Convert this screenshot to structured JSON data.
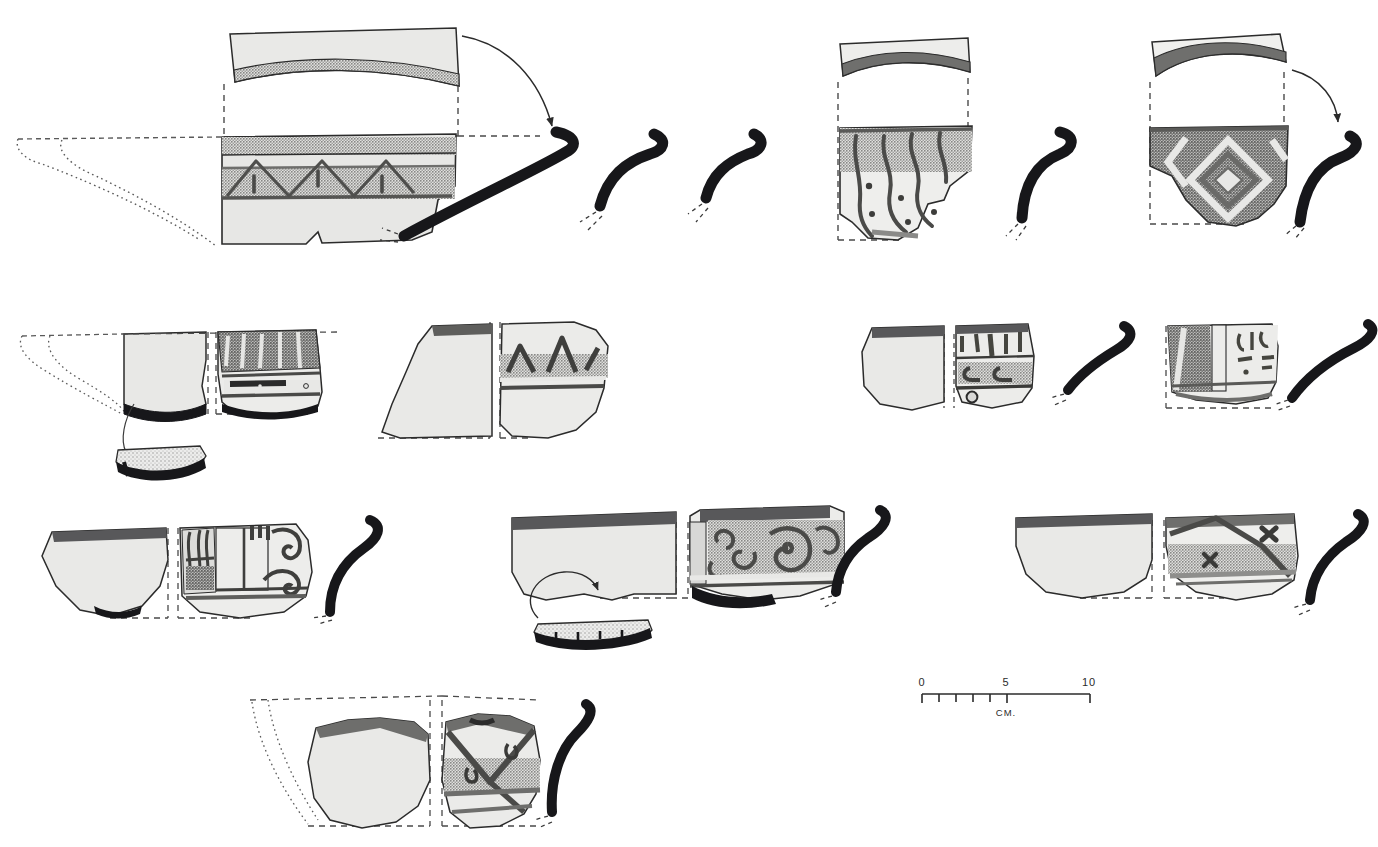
{
  "figure": {
    "type": "archaeological-pottery-plate",
    "medium": "ink drawing / halftone plate",
    "background_color": "#ffffff",
    "rows": 4,
    "total_entries": 14
  },
  "palette": {
    "outline": "#2b2b2b",
    "body_fill": "#e4e4e2",
    "stipple_light": "#c9c9c7",
    "stipple_mid": "#b2b2b0",
    "stipple_dark": "#9a9a98",
    "paint_band": "#7c7c7a",
    "paint_dark": "#58585a",
    "profile_black": "#17171a",
    "dash_line": "#4a4a4a",
    "dot_line": "#5a5a5a"
  },
  "scale_bar": {
    "name": "scale-bar",
    "unit_label": "CM.",
    "tick_labels": [
      "0",
      "5",
      "10"
    ],
    "minor_ticks": 5,
    "range_cm": [
      0,
      10
    ],
    "x": 920,
    "y": 688,
    "length_px": 168
  },
  "rows": [
    {
      "id": "row-1",
      "label": "Row 1",
      "entries": [
        {
          "id": "entry-1a",
          "label": "Rim sherd with chevron and stipple band",
          "kind": "sherd-with-profile",
          "has_reconstruction_outline": true,
          "has_detached_rim": true,
          "has_leader_arrow": true,
          "motif": "chevron-zigzag-with-vertical-dashes",
          "bands": [
            "stipple",
            "paint",
            "stipple"
          ]
        },
        {
          "id": "entry-1b",
          "label": "Rim profile (large curved)",
          "kind": "profile-only",
          "motif": "none"
        },
        {
          "id": "entry-1c",
          "label": "Rim profile (medium)",
          "kind": "profile-only",
          "motif": "none"
        },
        {
          "id": "entry-1d",
          "label": "Rim profile (small)",
          "kind": "profile-only",
          "motif": "none"
        },
        {
          "id": "entry-1e",
          "label": "Sherd with curvilinear dotted motif",
          "kind": "sherd-with-profile",
          "has_detached_rim": true,
          "motif": "curvilinear-loops-with-dots",
          "bands": [
            "stipple",
            "plain"
          ]
        },
        {
          "id": "entry-1f",
          "label": "Sherd with nested diamond motif",
          "kind": "sherd-with-profile",
          "has_detached_rim": true,
          "has_leader_arrow": true,
          "motif": "nested-diamonds-and-chevrons",
          "bands": [
            "paint",
            "stipple"
          ]
        }
      ]
    },
    {
      "id": "row-2",
      "label": "Row 2",
      "entries": [
        {
          "id": "entry-2a",
          "label": "Base sherd pair with ring-base detail",
          "kind": "sherd-pair-with-profile",
          "has_reconstruction_outline": true,
          "has_detail_inset": true,
          "motif": "vertical-strokes-over-banded-base"
        },
        {
          "id": "entry-2b",
          "label": "Body sherd pair with zigzag band",
          "kind": "sherd-pair",
          "motif": "zigzag-over-stipple-band"
        },
        {
          "id": "entry-2c",
          "label": "Sherd pair with pendant strokes and perforation",
          "kind": "sherd-pair-with-profile",
          "motif": "pendant-strokes-and-scroll-band",
          "has_perforation": true
        },
        {
          "id": "entry-2d",
          "label": "Panelled sherd with glyph marks",
          "kind": "sherd-with-profile",
          "motif": "vertical-panels-with-glyphs"
        }
      ]
    },
    {
      "id": "row-3",
      "label": "Row 3",
      "entries": [
        {
          "id": "entry-3a",
          "label": "Sherd pair with spiral and panel motif",
          "kind": "sherd-pair-with-profile",
          "motif": "running-spirals-and-rectilinear-panels"
        },
        {
          "id": "entry-3b",
          "label": "Sherd pair with running spiral band",
          "kind": "sherd-pair-with-profile",
          "has_detail_inset": true,
          "has_leader_arrow": true,
          "motif": "dense-running-spirals-on-stipple"
        },
        {
          "id": "entry-3c",
          "label": "Sherd pair with zigzag and cross marks",
          "kind": "sherd-pair-with-profile",
          "motif": "zigzag-band-with-x-crosses"
        }
      ]
    },
    {
      "id": "row-4",
      "label": "Row 4",
      "entries": [
        {
          "id": "entry-4a",
          "label": "Sherd pair with triangle and hook motif",
          "kind": "sherd-pair-with-profile",
          "has_reconstruction_outline": true,
          "motif": "triangles-with-hook-elements"
        }
      ]
    }
  ]
}
